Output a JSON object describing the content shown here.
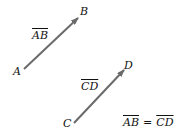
{
  "diagram": {
    "arrow_color": "#6a6a6a",
    "points": {
      "A": "A",
      "B": "B",
      "C": "C",
      "D": "D"
    },
    "vector_labels": {
      "ab": "AB",
      "cd": "CD"
    },
    "equation": {
      "left": "AB",
      "op": "=",
      "right": "CD"
    }
  }
}
